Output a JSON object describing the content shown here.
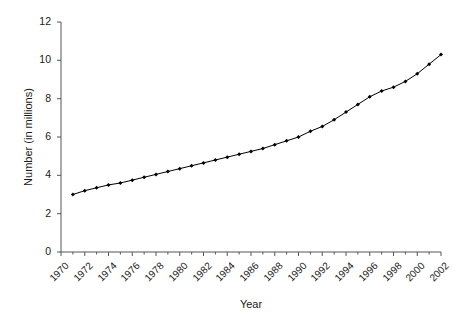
{
  "chart_data": {
    "type": "line",
    "title": "",
    "xlabel": "Year",
    "ylabel": "Number (in millions)",
    "xlim": [
      1970,
      2002
    ],
    "ylim": [
      0,
      12
    ],
    "grid": false,
    "legend": null,
    "marker": "filled-diamond",
    "line_color": "#000000",
    "x": [
      1971,
      1972,
      1973,
      1974,
      1975,
      1976,
      1977,
      1978,
      1979,
      1980,
      1981,
      1982,
      1983,
      1984,
      1985,
      1986,
      1987,
      1988,
      1989,
      1990,
      1991,
      1992,
      1993,
      1994,
      1995,
      1996,
      1997,
      1998,
      1999,
      2000,
      2001,
      2002
    ],
    "values": [
      3.0,
      3.2,
      3.35,
      3.5,
      3.6,
      3.75,
      3.9,
      4.05,
      4.2,
      4.35,
      4.5,
      4.65,
      4.8,
      4.95,
      5.1,
      5.25,
      5.4,
      5.6,
      5.8,
      6.0,
      6.3,
      6.55,
      6.9,
      7.3,
      7.7,
      8.1,
      8.4,
      8.6,
      8.9,
      9.3,
      9.8,
      10.3
    ],
    "y_ticks": [
      0,
      2,
      4,
      6,
      8,
      10,
      12
    ],
    "y_tick_labels": [
      "0",
      "2",
      "4",
      "6",
      "8",
      "10",
      "12"
    ],
    "x_ticks": [
      1970,
      1972,
      1974,
      1976,
      1978,
      1980,
      1982,
      1984,
      1986,
      1988,
      1990,
      1992,
      1994,
      1996,
      1998,
      2000,
      2002
    ],
    "x_tick_labels": [
      "1970",
      "1972",
      "1974",
      "1976",
      "1978",
      "1980",
      "1982",
      "1984",
      "1986",
      "1988",
      "1990",
      "1992",
      "1994",
      "1996",
      "1998",
      "2000",
      "2002"
    ],
    "x_minor_ticks": [
      1971,
      1973,
      1975,
      1977,
      1979,
      1981,
      1983,
      1985,
      1987,
      1989,
      1991,
      1993,
      1995,
      1997,
      1999,
      2001
    ],
    "axes": {
      "left_px": 61,
      "right_px": 441,
      "top_px": 22,
      "bottom_px": 252,
      "spines": [
        "left",
        "bottom"
      ],
      "spine_color": "#555555"
    }
  }
}
